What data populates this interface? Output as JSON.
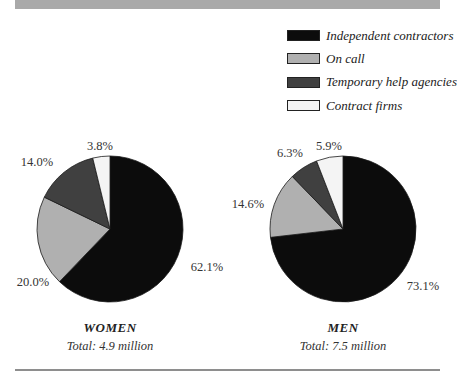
{
  "chart_data": {
    "type": "pie",
    "legend": {
      "placement": "top-right",
      "entries": [
        {
          "label": "Independent contractors",
          "color": "#0c0c0c"
        },
        {
          "label": "On call",
          "color": "#b0b0b0"
        },
        {
          "label": "Temporary help agencies",
          "color": "#404040"
        },
        {
          "label": "Contract firms",
          "color": "#f4f4f4"
        }
      ]
    },
    "charts": [
      {
        "title": "WOMEN",
        "subtitle": "Total:  4.9 million",
        "slices": [
          {
            "label": "Independent contractors",
            "value": 62.1,
            "display": "62.1%"
          },
          {
            "label": "On call",
            "value": 20.0,
            "display": "20.0%"
          },
          {
            "label": "Temporary help agencies",
            "value": 14.0,
            "display": "14.0%"
          },
          {
            "label": "Contract firms",
            "value": 3.8,
            "display": "3.8%"
          }
        ]
      },
      {
        "title": "MEN",
        "subtitle": "Total:  7.5 million",
        "slices": [
          {
            "label": "Independent contractors",
            "value": 73.1,
            "display": "73.1%"
          },
          {
            "label": "On call",
            "value": 14.6,
            "display": "14.6%"
          },
          {
            "label": "Temporary help agencies",
            "value": 6.3,
            "display": "6.3%"
          },
          {
            "label": "Contract firms",
            "value": 5.9,
            "display": "5.9%"
          }
        ]
      }
    ]
  }
}
